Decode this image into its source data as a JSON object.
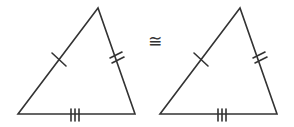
{
  "diagram": {
    "relation_symbol": "≅",
    "stroke_color": "#333333",
    "triangles": [
      {
        "name": "left-triangle",
        "vertices": [
          [
            98,
            8
          ],
          [
            18,
            114
          ],
          [
            135,
            114
          ]
        ],
        "side_marks": {
          "left_side": 1,
          "right_side": 2,
          "bottom_side": 3
        }
      },
      {
        "name": "right-triangle",
        "vertices": [
          [
            240,
            8
          ],
          [
            160,
            114
          ],
          [
            277,
            114
          ]
        ],
        "side_marks": {
          "left_side": 1,
          "right_side": 2,
          "bottom_side": 3
        }
      }
    ]
  }
}
